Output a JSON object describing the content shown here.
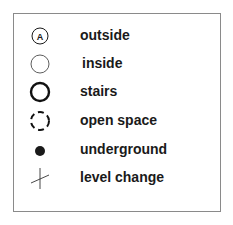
{
  "legend": {
    "items": [
      {
        "symbol": "circle-with-letter-icon",
        "symbol_letter": "A",
        "label": "outside"
      },
      {
        "symbol": "thin-circle-icon",
        "label": "inside"
      },
      {
        "symbol": "thick-circle-icon",
        "label": "stairs"
      },
      {
        "symbol": "dashed-circle-icon",
        "label": "open space"
      },
      {
        "symbol": "filled-dot-icon",
        "label": "underground"
      },
      {
        "symbol": "cross-tick-icon",
        "label": "level change"
      }
    ]
  },
  "colors": {
    "ink": "#1a1a1a",
    "frame": "#8a8a8a"
  }
}
